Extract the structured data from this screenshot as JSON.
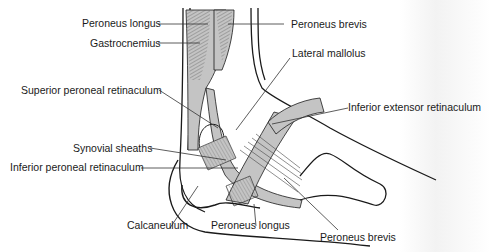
{
  "figure": {
    "colors": {
      "tendon_fill": "#c4c4c4",
      "outline": "#1a1a1a",
      "leader": "#333333",
      "background": "#ffffff"
    },
    "labels": [
      {
        "id": "peroneus-longus-top",
        "text": "Peroneus longus"
      },
      {
        "id": "peroneus-brevis-top",
        "text": "Peroneus brevis"
      },
      {
        "id": "gastrocnemius",
        "text": "Gastrocnemius"
      },
      {
        "id": "lateral-mallolus",
        "text": "Lateral mallolus"
      },
      {
        "id": "superior-peroneal-retinaculum",
        "text": "Superior peroneal retinaculum"
      },
      {
        "id": "inferior-extensor-retinaculum",
        "text": "Inferior extensor retinaculum"
      },
      {
        "id": "synovial-sheaths",
        "text": "Synovial sheaths"
      },
      {
        "id": "inferior-peroneal-retinaculum",
        "text": "Inferior peroneal retinaculum"
      },
      {
        "id": "calcaneulum",
        "text": "Calcaneulum"
      },
      {
        "id": "peroneus-longus-bottom",
        "text": "Peroneus longus"
      },
      {
        "id": "peroneus-brevis-bottom",
        "text": "Peroneus brevis"
      }
    ]
  }
}
